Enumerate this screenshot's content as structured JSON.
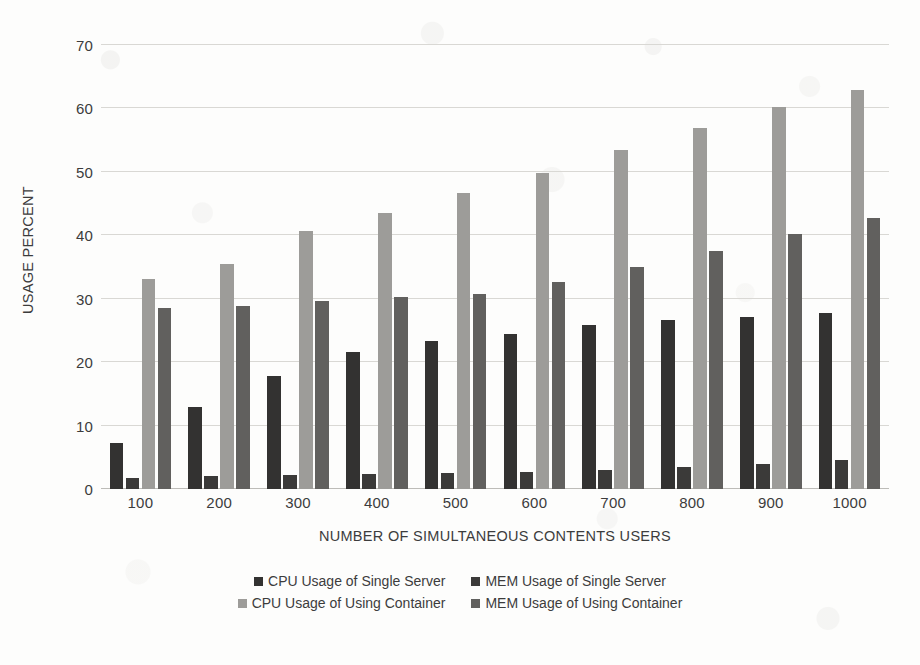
{
  "chart_data": {
    "type": "bar",
    "title": "",
    "xlabel": "NUMBER OF SIMULTANEOUS CONTENTS USERS",
    "ylabel": "USAGE PERCENT",
    "categories": [
      "100",
      "200",
      "300",
      "400",
      "500",
      "600",
      "700",
      "800",
      "900",
      "1000"
    ],
    "ylim": [
      0,
      70
    ],
    "yticks": [
      0,
      10,
      20,
      30,
      40,
      50,
      60,
      70
    ],
    "grid": true,
    "legend_position": "bottom",
    "series": [
      {
        "name": "CPU Usage of Single Server",
        "color": "#333231",
        "values": [
          7.3,
          12.9,
          17.8,
          21.6,
          23.4,
          24.5,
          25.8,
          26.6,
          27.1,
          27.7
        ]
      },
      {
        "name": "MEM Usage of Single Server",
        "color": "#3b3a39",
        "values": [
          1.8,
          2.0,
          2.2,
          2.4,
          2.6,
          2.7,
          3.0,
          3.4,
          3.9,
          4.6
        ]
      },
      {
        "name": "CPU Usage of Using Container",
        "color": "#9d9c99",
        "values": [
          33.1,
          35.4,
          40.7,
          43.5,
          46.7,
          49.8,
          53.5,
          56.9,
          60.3,
          62.9
        ]
      },
      {
        "name": "MEM Usage of Using Container",
        "color": "#61605e",
        "values": [
          28.5,
          28.8,
          29.6,
          30.2,
          30.8,
          32.6,
          35.0,
          37.6,
          40.2,
          42.7
        ]
      }
    ]
  }
}
